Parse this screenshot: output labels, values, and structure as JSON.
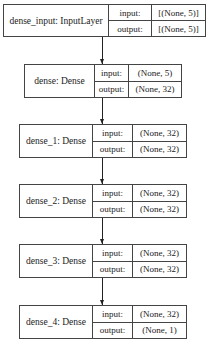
{
  "diagram": {
    "type": "keras-model-plot",
    "nodes": [
      {
        "label": "dense_input: InputLayer",
        "ports": [
          {
            "name": "input:",
            "value": "[(None, 5)]"
          },
          {
            "name": "output:",
            "value": "[(None, 5)]"
          }
        ]
      },
      {
        "label": "dense: Dense",
        "ports": [
          {
            "name": "input:",
            "value": "(None, 5)"
          },
          {
            "name": "output:",
            "value": "(None, 32)"
          }
        ]
      },
      {
        "label": "dense_1: Dense",
        "ports": [
          {
            "name": "input:",
            "value": "(None, 32)"
          },
          {
            "name": "output:",
            "value": "(None, 32)"
          }
        ]
      },
      {
        "label": "dense_2: Dense",
        "ports": [
          {
            "name": "input:",
            "value": "(None, 32)"
          },
          {
            "name": "output:",
            "value": "(None, 32)"
          }
        ]
      },
      {
        "label": "dense_3: Dense",
        "ports": [
          {
            "name": "input:",
            "value": "(None, 32)"
          },
          {
            "name": "output:",
            "value": "(None, 32)"
          }
        ]
      },
      {
        "label": "dense_4: Dense",
        "ports": [
          {
            "name": "input:",
            "value": "(None, 32)"
          },
          {
            "name": "output:",
            "value": "(None, 1)"
          }
        ]
      }
    ],
    "edges": [
      {
        "from": "dense_input",
        "to": "dense"
      },
      {
        "from": "dense",
        "to": "dense_1"
      },
      {
        "from": "dense_1",
        "to": "dense_2"
      },
      {
        "from": "dense_2",
        "to": "dense_3"
      },
      {
        "from": "dense_3",
        "to": "dense_4"
      }
    ],
    "colors": {
      "border": "#444444",
      "text": "#222222",
      "background": "#ffffff"
    }
  }
}
